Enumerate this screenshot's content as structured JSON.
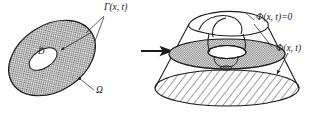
{
  "figure": {
    "background_color": "#ffffff",
    "stroke_color": "#1a1a1a",
    "labels": {
      "gamma": "Γ(x, t)",
      "omega": "Ω",
      "d_tilde_base": "D",
      "d_tilde_accent": "~",
      "phi_zero": "Φ(x, t)=0",
      "phi": "Φ(x, t)"
    },
    "left_panel": {
      "name": "domain-diagram",
      "outer_region_label": "Ω",
      "inner_region_label": "D",
      "boundary_label": "Γ(x, t)",
      "fill_pattern": "crosshatch"
    },
    "arrow": {
      "name": "transition-arrow",
      "direction": "right"
    },
    "right_panel": {
      "name": "level-set-diagram",
      "zero_level_label": "Φ(x, t)=0",
      "surface_label": "Φ(x, t)",
      "slice_fill_pattern": "crosshatch",
      "base_fill_pattern": "diagonal-hatch"
    }
  }
}
